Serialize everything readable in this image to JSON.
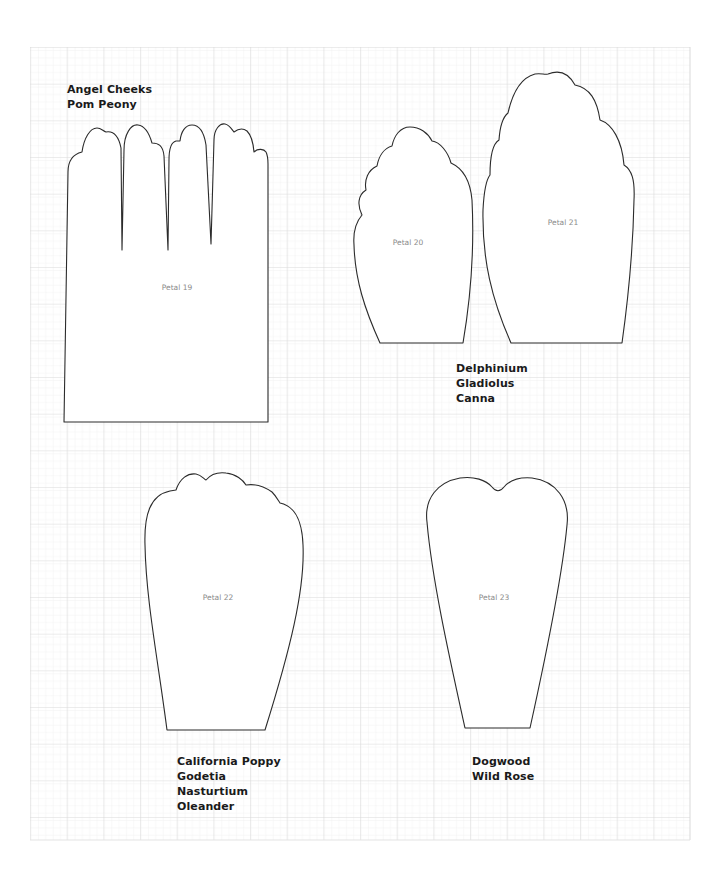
{
  "sheet": {
    "grid": {
      "x": 30,
      "y": 47,
      "width": 660,
      "height": 793,
      "major_spacing": 36.67,
      "minor_spacing": 7.333,
      "major_color": "#d9d9d9",
      "minor_color": "#efefef",
      "background": "#ffffff"
    },
    "outline_color": "#2b2b2b",
    "petals": [
      {
        "id": "petal-19",
        "label": "Petal 19",
        "label_x": 177,
        "label_y": 283
      },
      {
        "id": "petal-20",
        "label": "Petal 20",
        "label_x": 408,
        "label_y": 238
      },
      {
        "id": "petal-21",
        "label": "Petal 21",
        "label_x": 563,
        "label_y": 218
      },
      {
        "id": "petal-22",
        "label": "Petal 22",
        "label_x": 218,
        "label_y": 593
      },
      {
        "id": "petal-23",
        "label": "Petal 23",
        "label_x": 494,
        "label_y": 593
      }
    ],
    "flower_groups": [
      {
        "for": "petal-19",
        "x": 67,
        "y": 82,
        "names": [
          "Angel Cheeks",
          "Pom Peony"
        ]
      },
      {
        "for": "petal-20-21",
        "x": 456,
        "y": 361,
        "names": [
          "Delphinium",
          "Gladiolus",
          "Canna"
        ]
      },
      {
        "for": "petal-22",
        "x": 177,
        "y": 754,
        "names": [
          "California Poppy",
          "Godetia",
          "Nasturtium",
          "Oleander"
        ]
      },
      {
        "for": "petal-23",
        "x": 472,
        "y": 754,
        "names": [
          "Dogwood",
          "Wild Rose"
        ]
      }
    ]
  }
}
